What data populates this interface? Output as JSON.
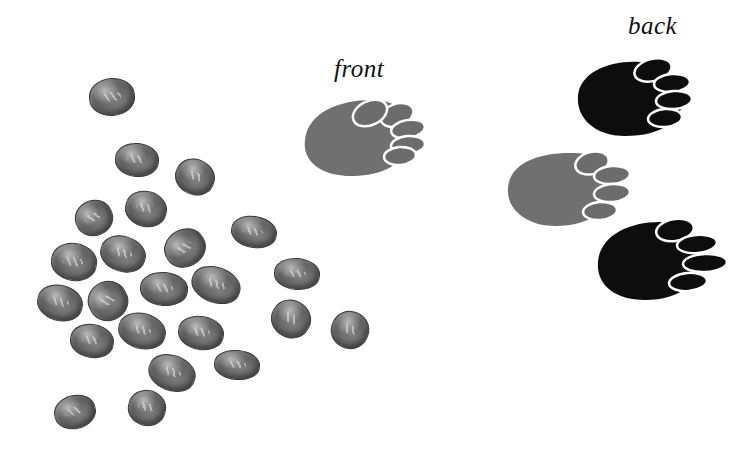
{
  "labels": {
    "front": "front",
    "back": "back"
  },
  "colors": {
    "front_paw": "#6f6f6f",
    "back_paw": "#0d0d0d",
    "toe_outline": "#ffffff",
    "scat": "#666666",
    "background": "#ffffff"
  },
  "scene": {
    "description": "Illustration of animal tracks (front and back paw prints) and a scattered pile of droppings",
    "scat_count": 23,
    "paw_prints": [
      {
        "name": "front-print-upper",
        "type": "front",
        "color": "gray"
      },
      {
        "name": "back-print-upper",
        "type": "back",
        "color": "black"
      },
      {
        "name": "front-print-lower",
        "type": "front",
        "color": "gray"
      },
      {
        "name": "back-print-lower",
        "type": "back",
        "color": "black"
      }
    ]
  }
}
